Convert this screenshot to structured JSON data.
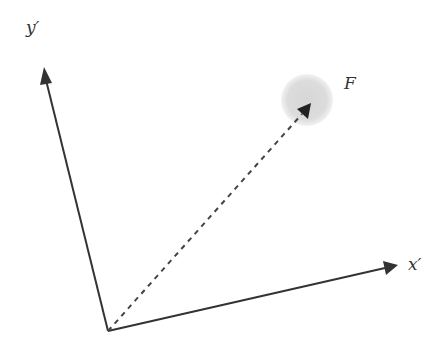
{
  "diagram": {
    "labels": {
      "y_axis": "y′",
      "x_axis": "x′",
      "point": "F"
    },
    "colors": {
      "line": "#333333",
      "blob": "#d9d9d9"
    }
  }
}
